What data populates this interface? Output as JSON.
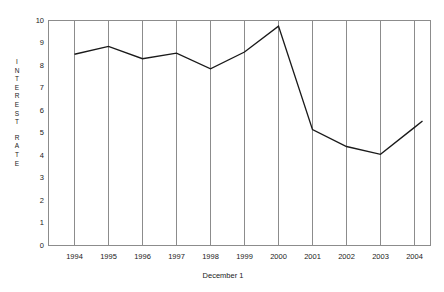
{
  "chart_data": {
    "type": "line",
    "title": "",
    "subtitle": "",
    "xlabel": "December 1",
    "ylabel": "INTEREST RATE",
    "categories": [
      "1994",
      "1995",
      "1996",
      "1997",
      "1998",
      "1999",
      "2000",
      "2001",
      "2002",
      "2003",
      "2004"
    ],
    "values": [
      8.5,
      8.85,
      8.3,
      8.55,
      7.85,
      8.6,
      9.75,
      5.15,
      4.4,
      4.05,
      5.25
    ],
    "series": [
      {
        "name": "Interest Rate",
        "values": [
          8.5,
          8.85,
          8.3,
          8.55,
          7.85,
          8.6,
          9.75,
          5.15,
          4.4,
          4.05,
          5.25
        ]
      }
    ],
    "ylim": [
      0,
      10
    ],
    "y_ticks": [
      10,
      9,
      8,
      7,
      6,
      5,
      4,
      3,
      2,
      1,
      0
    ],
    "y_tick_labels": [
      "10",
      "9",
      "8",
      "7",
      "6",
      "5",
      "4",
      "3",
      "2",
      "1",
      "0"
    ],
    "x_tick_labels": [
      "1994",
      "1995",
      "1996",
      "1997",
      "1998",
      "1999",
      "2000",
      "2001",
      "2002",
      "2003",
      "2004"
    ],
    "grid": "vertical",
    "legend": "none",
    "line_color": "#1a1a1a",
    "grid_color": "#8c8c8c",
    "axis_color": "#8c8c8c",
    "background_color": "#ffffff",
    "annotations": []
  },
  "y_axis_title_letters": [
    "I",
    "N",
    "T",
    "E",
    "R",
    "E",
    "S",
    "T",
    "",
    "R",
    "A",
    "T",
    "E"
  ]
}
